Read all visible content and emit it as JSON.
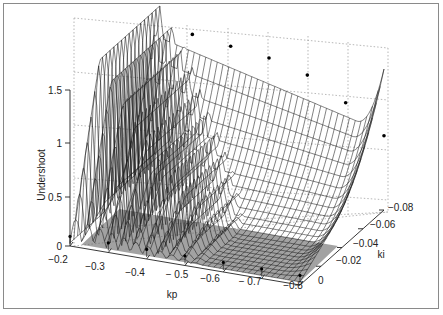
{
  "chart_data": {
    "type": "surface3d",
    "title": "",
    "xlabel": "kp",
    "ylabel": "ki",
    "zlabel": "Undershoot",
    "x_ticks": [
      "-0.2",
      "-0.3",
      "-0.4",
      "-0.5",
      "-0.6",
      "-0.7",
      "-0.8"
    ],
    "y_ticks": [
      "0",
      "-0.02",
      "-0.04",
      "-0.06",
      "-0.08"
    ],
    "z_ticks": [
      "0",
      "0.5",
      "1",
      "1.5"
    ],
    "xlim": [
      -0.2,
      -0.8
    ],
    "ylim": [
      0,
      -0.08
    ],
    "zlim": [
      0,
      1.9
    ],
    "grid": true,
    "highlight_points": [
      {
        "kp": -0.24,
        "ki": -0.08,
        "z": 1.85
      },
      {
        "kp": -0.3,
        "ki": -0.08,
        "z": 1.35
      },
      {
        "kp": -0.4,
        "ki": -0.08,
        "z": 1.3
      },
      {
        "kp": -0.5,
        "ki": -0.08,
        "z": 1.25
      },
      {
        "kp": -0.6,
        "ki": -0.08,
        "z": 1.15
      },
      {
        "kp": -0.7,
        "ki": -0.08,
        "z": 0.95
      },
      {
        "kp": -0.8,
        "ki": -0.08,
        "z": 0.7
      }
    ]
  },
  "axes": {
    "z_label": "Undershoot",
    "x_label": "kp",
    "y_label": "ki",
    "z_ticks": [
      {
        "label": "0",
        "y": 246
      },
      {
        "label": "0.5",
        "y": 197
      },
      {
        "label": "1",
        "y": 143
      },
      {
        "label": "1.5",
        "y": 90
      }
    ],
    "x_ticks": [
      {
        "label": "−0.2",
        "x": 58,
        "y": 263
      },
      {
        "label": "−0.3",
        "x": 95,
        "y": 270
      },
      {
        "label": "−0.4",
        "x": 135,
        "y": 276
      },
      {
        "label": "− 0.5",
        "x": 177,
        "y": 278
      },
      {
        "label": "−0.6",
        "x": 210,
        "y": 282
      },
      {
        "label": "− 0.7",
        "x": 250,
        "y": 285
      },
      {
        "label": "−0.8",
        "x": 293,
        "y": 289
      }
    ],
    "y_ticks": [
      {
        "label": "0",
        "x": 318,
        "y": 284
      },
      {
        "label": "−0.02",
        "x": 336,
        "y": 264
      },
      {
        "label": "−0.04",
        "x": 353,
        "y": 247
      },
      {
        "label": "−0.06",
        "x": 370,
        "y": 228
      },
      {
        "label": "−0.08",
        "x": 388,
        "y": 211
      }
    ]
  }
}
